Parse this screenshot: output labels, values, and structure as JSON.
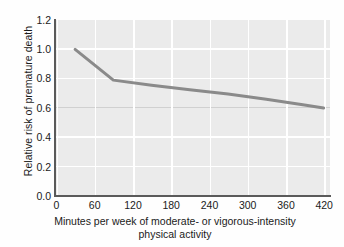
{
  "chart_data": {
    "type": "line",
    "title": "",
    "subtitle": "",
    "xlabel": "Minutes per week of moderate- or vigorous-intensity physical activity",
    "xlabel_line1": "Minutes per week of moderate- or vigorous-intensity",
    "xlabel_line2": "physical activity",
    "ylabel": "Relative risk of premature death",
    "xlim": [
      0,
      430
    ],
    "ylim": [
      0.0,
      1.2
    ],
    "xticks": [
      0,
      60,
      120,
      180,
      240,
      300,
      360,
      420
    ],
    "xtick_labels": [
      "0",
      "60",
      "120",
      "180",
      "240",
      "300",
      "360",
      "420"
    ],
    "yticks": [
      0.0,
      0.2,
      0.4,
      0.6,
      0.8,
      1.0,
      1.2
    ],
    "ytick_labels": [
      "0.0",
      "0.2",
      "0.4",
      "0.6",
      "0.8",
      "1.0",
      "1.2"
    ],
    "grid": true,
    "grid_color": "#ffffff",
    "plot_background": "#ebebeb",
    "legend": null,
    "legend_position": "none",
    "series": [
      {
        "name": "Relative risk of premature death",
        "color": "#8a8a8a",
        "line_width": 3,
        "x": [
          30,
          90,
          150,
          210,
          270,
          330,
          390,
          420
        ],
        "values": [
          1.0,
          0.79,
          0.755,
          0.725,
          0.695,
          0.66,
          0.62,
          0.6
        ]
      }
    ],
    "annotations": []
  },
  "axes": {
    "y_title": "Relative risk of premature death",
    "x_title_line1": "Minutes per week of moderate- or vigorous-intensity",
    "x_title_line2": "physical activity"
  }
}
